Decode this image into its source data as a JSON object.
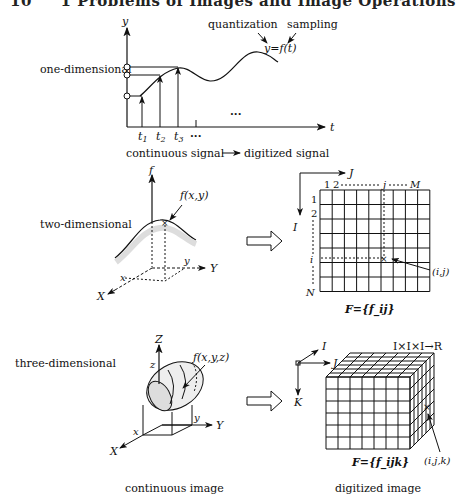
{
  "header": {
    "page_number": "10",
    "running_title": "1 Problems of Images and Image Operations"
  },
  "rows": [
    {
      "label": "one-dimensional"
    },
    {
      "label": "two-dimensional"
    },
    {
      "label": "three-dimensional"
    }
  ],
  "one_d": {
    "y_axis": "y",
    "t_axis": "t",
    "function_label": "y=f(t)",
    "quantization_label": "quantization",
    "sampling_label": "sampling",
    "ticks": [
      "t1",
      "t2",
      "t3",
      "..."
    ],
    "ellipsis": "...",
    "caption_left": "continuous signal",
    "caption_right": "digitized signal"
  },
  "two_d": {
    "f_axis": "f",
    "function_label": "f(x,y)",
    "x_label": "x",
    "y_label": "y",
    "X_axis": "X",
    "Y_axis": "Y",
    "J_axis": "J",
    "I_axis": "I",
    "col_labels": [
      "1",
      "2",
      "j",
      "M"
    ],
    "row_labels": [
      "1",
      "2",
      "i",
      "N"
    ],
    "point_label": "(i,j)",
    "matrix_label": "F={f_ij}",
    "grid_cols": 9,
    "grid_rows": 7
  },
  "three_d": {
    "Z_axis": "Z",
    "Y_axis": "Y",
    "X_axis": "X",
    "z_label": "z",
    "y_label": "y",
    "x_label": "x",
    "function_label": "f(x,y,z)",
    "I_axis": "I",
    "J_axis": "J",
    "K_axis": "K",
    "mapping": "I×I×I→R",
    "point_label": "(i,j,k)",
    "matrix_label": "F={f_ijk}"
  },
  "captions": {
    "continuous": "continuous image",
    "digitized": "digitized image"
  }
}
